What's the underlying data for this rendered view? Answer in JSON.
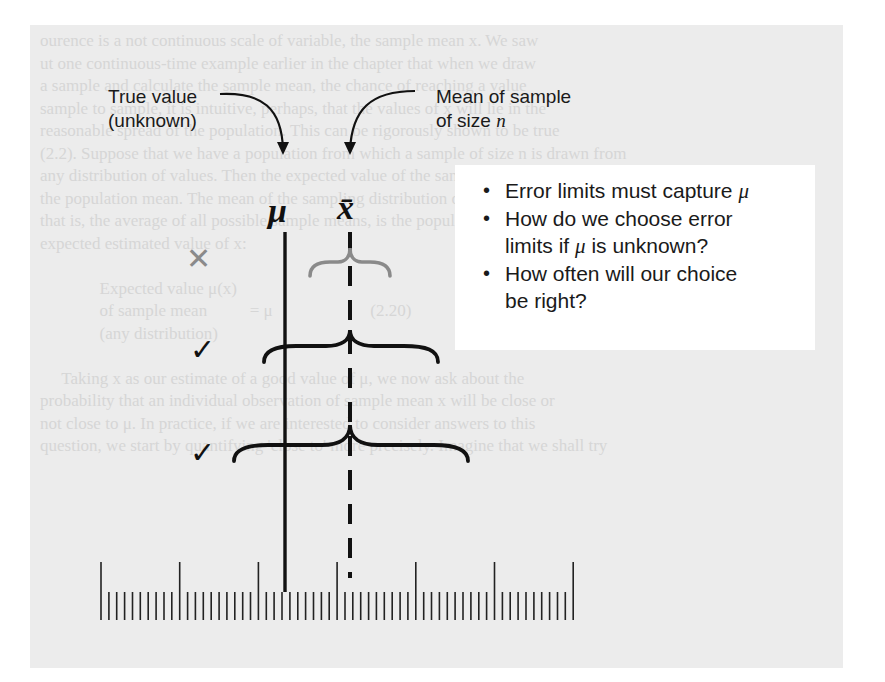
{
  "labels": {
    "true_value_line1": "True value",
    "true_value_line2": "(unknown)",
    "sample_mean_line1": "Mean of sample",
    "sample_mean_line2_prefix": "of size ",
    "sample_mean_line2_var": "n"
  },
  "symbols": {
    "mu": "μ",
    "xbar": "x̄"
  },
  "bullets": [
    {
      "text": "Error limits must capture ",
      "var": "μ",
      "rest": ""
    },
    {
      "text": "How do we choose error",
      "var": "",
      "rest": ""
    },
    {
      "text": "limits if ",
      "var": "μ",
      "rest": " is unknown?",
      "continuation": true
    },
    {
      "text": "How often will our choice",
      "var": "",
      "rest": ""
    },
    {
      "text": "be right?",
      "var": "",
      "rest": "",
      "continuation": true
    }
  ],
  "marks": {
    "miss": "✕",
    "hit_1": "✓",
    "hit_2": "✓"
  },
  "error_limits": [
    {
      "id": "interval-1",
      "result": "miss",
      "color": "#8a8a8a",
      "x_left": 308,
      "x_right": 392,
      "y": 262
    },
    {
      "id": "interval-2",
      "result": "hit",
      "color": "#111111",
      "x_left": 262,
      "x_right": 440,
      "y": 345
    },
    {
      "id": "interval-3",
      "result": "hit",
      "color": "#111111",
      "x_left": 232,
      "x_right": 470,
      "y": 445
    }
  ],
  "ruler": {
    "start_x": 101,
    "spacing": 7.87,
    "count": 61,
    "major_every": 10
  },
  "colors": {
    "ink": "#111111",
    "miss_gray": "#8a8a8a",
    "page_gray": "#ececec",
    "box_white": "#ffffff"
  },
  "background_text": [
    "ourence is a not continuous scale of variable, the sample mean x. We saw",
    "ut one continuous-time example earlier in the chapter that when we draw",
    "a sample and calculate the sample mean, the chance of reaching a value",
    "sample to sample, it is intuitive, perhaps, that the values of x will lie in the",
    "reasonable spread of the population. This can be rigorously shown to be true",
    "(2.2). Suppose that we have a population from which a sample of size n is drawn from",
    "any distribution of values. Then the expected value of the sample mean is",
    "the population mean. The mean of the sampling distribution of x,",
    "that is, the average of all possible sample means, is the population mean, as a",
    "expected estimated value of x:",
    "",
    "              Expected value μ(x)",
    "              of sample mean          = μ                       (2.20)",
    "              (any distribution)",
    "",
    "     Taking x as our estimate of a good value of μ, we now ask about the",
    "probability that an individual observation of sample mean x will be close or",
    "not close to μ. In practice, if we are interested to consider answers to this",
    "question, we start by quantifying 'close to' more precisely. Imagine that we shall try",
    "                                                                                  "
  ]
}
